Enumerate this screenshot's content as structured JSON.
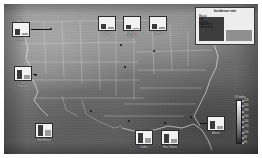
{
  "figure": {
    "kind": "choropleth-map-with-inset-bar-charts",
    "region": "United States",
    "basemap_style": "grayscale-shaded"
  },
  "legend_key": {
    "title": "Incidence rate",
    "series": [
      {
        "name": "Basal cell cancer",
        "label": "Basal\ncell\ncancer",
        "color": "#3d3d3d",
        "relative_height": 24
      },
      {
        "name": "Squamous cell cancer",
        "label": "Squamous\ncell cancer",
        "color": "#8f8f8f",
        "relative_height": 11
      }
    ]
  },
  "colorbar": {
    "title": "UV\nindex",
    "orientation": "vertical",
    "low_color": "#fdfdfd",
    "high_color": "#262626",
    "ticks": [
      {
        "value": "220",
        "pos": 2
      },
      {
        "value": "200",
        "pos": 14
      },
      {
        "value": "180",
        "pos": 26
      },
      {
        "value": "160",
        "pos": 38
      },
      {
        "value": "140",
        "pos": 50
      },
      {
        "value": "120",
        "pos": 62
      },
      {
        "value": "100",
        "pos": 74
      },
      {
        "value": "80",
        "pos": 86
      },
      {
        "value": "60",
        "pos": 98
      }
    ]
  },
  "chart_data": {
    "type": "bar",
    "title": "Incidence rate",
    "xlabel": "",
    "ylabel": "Incidence rate",
    "categories": [
      "Seattle",
      "San Francisco",
      "New Mexico",
      "Iowa",
      "Minn./St. Paul",
      "Detroit",
      "Dallas",
      "New Orleans",
      "Atlanta"
    ],
    "series": [
      {
        "name": "Basal cell cancer",
        "color": "#3a3a3a",
        "values": [
          6,
          9,
          11,
          5,
          4,
          5,
          10,
          9,
          8
        ]
      },
      {
        "name": "Squamous cell cancer",
        "color": "#9a9a9a",
        "values": [
          2,
          4,
          6,
          2,
          1,
          2,
          5,
          4,
          3
        ]
      }
    ],
    "ylim": [
      0,
      12
    ],
    "grid": false,
    "legend_position": "top-right"
  },
  "sites": [
    {
      "id": "seattle",
      "label": "Seattle",
      "panel_x": 8,
      "panel_y": 18,
      "dot_x": 46,
      "dot_y": 24,
      "leader_x": 27,
      "leader_y": 25,
      "leader_w": 19,
      "basal": 6,
      "squam": 2
    },
    {
      "id": "san-francisco",
      "label": "San\nFrancisco",
      "panel_x": 10,
      "panel_y": 62,
      "dot_x": 31,
      "dot_y": 70,
      "leader_x": 29,
      "leader_y": 70,
      "leader_w": 3,
      "basal": 9,
      "squam": 4
    },
    {
      "id": "new-mexico",
      "label": "New Mexico",
      "panel_x": 31,
      "panel_y": 119,
      "dot_x": 86,
      "dot_y": 106,
      "leader_x": 50,
      "leader_y": 122,
      "leader_w": 0,
      "basal": 11,
      "squam": 6
    },
    {
      "id": "iowa",
      "label": "Iowa",
      "panel_x": 94,
      "panel_y": 12,
      "dot_x": 120,
      "dot_y": 62,
      "leader_x": 103,
      "leader_y": 28,
      "leader_w": 0,
      "basal": 5,
      "squam": 2
    },
    {
      "id": "minn-st-paul",
      "label": "Minn./\nSt. Paul",
      "panel_x": 119,
      "panel_y": 12,
      "dot_x": 116,
      "dot_y": 40,
      "leader_x": 128,
      "leader_y": 28,
      "leader_w": 0,
      "basal": 4,
      "squam": 1
    },
    {
      "id": "detroit",
      "label": "Detroit",
      "panel_x": 145,
      "panel_y": 12,
      "dot_x": 149,
      "dot_y": 46,
      "leader_x": 154,
      "leader_y": 28,
      "leader_w": 0,
      "basal": 5,
      "squam": 2
    },
    {
      "id": "dallas",
      "label": "Dallas",
      "panel_x": 131,
      "panel_y": 126,
      "dot_x": 124,
      "dot_y": 116,
      "leader_x": 140,
      "leader_y": 124,
      "leader_w": 0,
      "basal": 10,
      "squam": 5
    },
    {
      "id": "new-orleans",
      "label": "New Orleans",
      "panel_x": 157,
      "panel_y": 126,
      "dot_x": 160,
      "dot_y": 118,
      "leader_x": 166,
      "leader_y": 124,
      "leader_w": 0,
      "basal": 9,
      "squam": 4
    },
    {
      "id": "atlanta",
      "label": "Atlanta",
      "panel_x": 203,
      "panel_y": 112,
      "dot_x": 186,
      "dot_y": 112,
      "leader_x": 196,
      "leader_y": 119,
      "leader_w": 7,
      "basal": 8,
      "squam": 3
    }
  ]
}
